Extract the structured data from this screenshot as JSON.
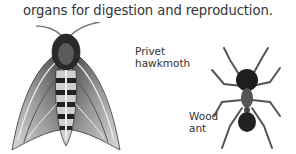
{
  "text": {
    "body_line": "organs for digestion and reproduction."
  },
  "illustrations": [
    {
      "id": "moth",
      "label_lines": [
        "Privet",
        "hawkmoth"
      ],
      "icon": "moth-illustration"
    },
    {
      "id": "ant",
      "label_lines": [
        "Wood",
        "ant"
      ],
      "icon": "ant-illustration"
    }
  ],
  "colors": {
    "background": "#ffffff",
    "text": "#333333",
    "ink_dark": "#1e1e1e",
    "ink_mid": "#6b6b6b",
    "ink_light": "#bdbdbd"
  }
}
